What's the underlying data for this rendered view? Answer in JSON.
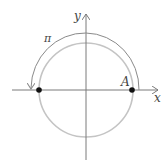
{
  "diagram": {
    "labels": {
      "y_axis": "y",
      "x_axis": "x",
      "arc": "π",
      "point_a": "A"
    },
    "colors": {
      "axis": "#7a7a7a",
      "circle": "#c4c4c4",
      "arc": "#8a8a8a",
      "point": "#111111",
      "text": "#444444"
    }
  }
}
